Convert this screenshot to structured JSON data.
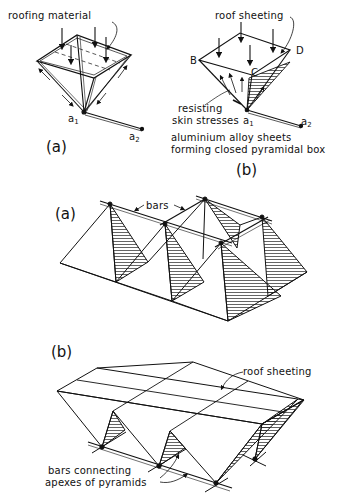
{
  "figure_top": {
    "part_a": {
      "caption": "(a)",
      "label_roofing": "roofing material",
      "point_a1": "a",
      "point_a1_sub": "1",
      "point_a2": "a",
      "point_a2_sub": "2"
    },
    "part_b": {
      "caption": "(b)",
      "label_roof": "roof sheeting",
      "vertex_b": "B",
      "vertex_c": "C",
      "vertex_d": "D",
      "label_resisting_1": "resisting",
      "label_resisting_2": "skin stresses",
      "point_a1": "a",
      "point_a1_sub": "1",
      "point_a2": "a",
      "point_a2_sub": "2",
      "desc_line1": "aluminium alloy sheets",
      "desc_line2": "forming closed pyramidal box"
    }
  },
  "figure_middle": {
    "caption": "(a)",
    "label_bars": "bars"
  },
  "figure_bottom": {
    "caption": "(b)",
    "label_roof": "roof sheeting",
    "label_bars_1": "bars connecting",
    "label_bars_2": "apexes of pyramids"
  }
}
